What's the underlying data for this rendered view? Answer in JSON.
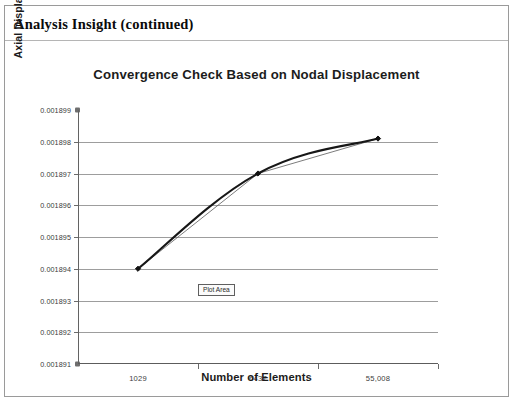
{
  "document": {
    "header_title": "Analysis Insight (continued)"
  },
  "chart_ui": {
    "plot_area_tooltip": "Plot Area"
  },
  "chart_data": {
    "type": "line",
    "title": "Convergence Check Based on Nodal Displacement",
    "xlabel": "Number of Elements",
    "ylabel": "Axial Displacement (In)",
    "categories": [
      "1029",
      "6437",
      "55,008"
    ],
    "values": [
      0.001894,
      0.001897,
      0.0018981
    ],
    "series": [
      {
        "name": "Axial Displacement",
        "values": [
          0.001894,
          0.001897,
          0.0018981
        ]
      }
    ],
    "ylim": [
      0.001891,
      0.001899
    ],
    "ytick_labels": [
      "0.001899",
      "0.001898",
      "0.001897",
      "0.001896",
      "0.001895",
      "0.001894",
      "0.001893",
      "0.001892",
      "0.001891"
    ],
    "ytick_values": [
      0.001899,
      0.001898,
      0.001897,
      0.001896,
      0.001895,
      0.001894,
      0.001893,
      0.001892,
      0.001891
    ],
    "xtick_labels": [
      "1029",
      "6437",
      "55,008"
    ],
    "grid": true,
    "legend": "none",
    "smoothed_line": true,
    "marker": "diamond",
    "line_color": "#1a1a1a",
    "grid_color": "#9d9d9d"
  }
}
